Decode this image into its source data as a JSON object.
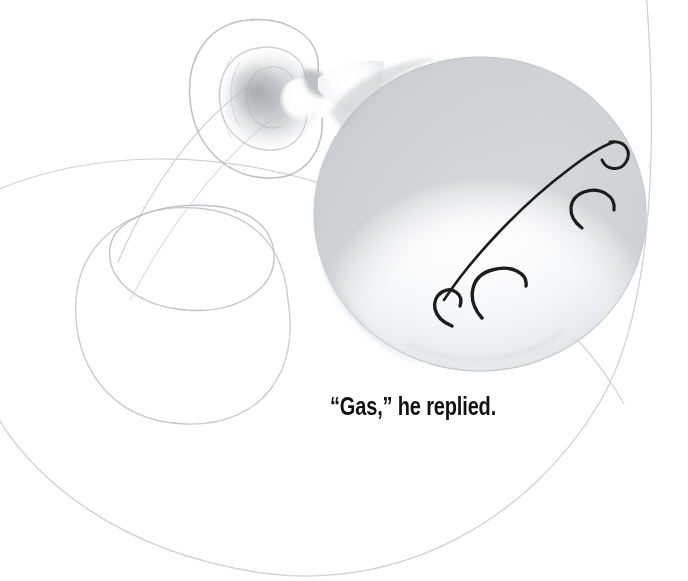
{
  "illustration": {
    "title": "Balloon with curly string",
    "medium": "pencil-sketch",
    "background_color": "#ffffff",
    "subject_names": {
      "balloon": "balloon-body",
      "knot": "balloon-knot",
      "string": "balloon-string-spiral",
      "motion_lines": "gas-motion-lines"
    }
  },
  "caption": {
    "text": "“Gas,” he replied.",
    "color": "#111111",
    "x": 330,
    "y": 392,
    "font_size_px": 25,
    "weight": "bold",
    "style": "condensed-sans"
  },
  "palette": {
    "paper": "#ffffff",
    "pencil_light": "#cfd0d2",
    "pencil_mid": "#a9abae",
    "pencil_dark": "#8e9094",
    "balloon_fill_light": "#fbfbfc",
    "balloon_fill_shadow": "#e4e5e7",
    "balloon_edge": "#c2c4c7",
    "knot_smudge": "#b9bbbe",
    "ink_black": "#1a1a1a"
  },
  "shapes": {
    "balloon": {
      "name": "balloon-body",
      "center_x": 478,
      "center_y": 213,
      "radius_x": 168,
      "radius_y": 158,
      "description": "large round shaded balloon occupying the right-center of the frame"
    },
    "knot": {
      "name": "balloon-knot",
      "center_x": 272,
      "center_y": 95,
      "radius": 45,
      "description": "dark pencil smudge knot with white highlight at the balloon neck"
    },
    "neck": {
      "name": "balloon-neck",
      "x": 300,
      "y": 70,
      "width": 34,
      "height": 30
    },
    "string_loops": [
      {
        "name": "string-loop-top",
        "cx": 255,
        "cy": 88,
        "rx": 66,
        "ry": 72
      },
      {
        "name": "string-loop-inner-small",
        "cx": 268,
        "cy": 100,
        "rx": 34,
        "ry": 42
      },
      {
        "name": "string-loop-mid",
        "cx": 192,
        "cy": 257,
        "rx": 84,
        "ry": 53
      },
      {
        "name": "string-loop-large",
        "cx": 183,
        "cy": 321,
        "rx": 108,
        "ry": 100
      }
    ],
    "outer_arc": {
      "name": "outer-sweep-arc",
      "description": "very large faint pencil arc sweeping from the left edge, down across the bottom, and up off the top-right corner",
      "left_edge_y": 196,
      "bottom_y": 574,
      "top_right_x": 646
    },
    "motion_lines": [
      {
        "name": "main-diagonal-stroke",
        "from_x": 440,
        "from_y": 322,
        "to_x": 618,
        "to_y": 143,
        "has_curl_both_ends": true
      },
      {
        "name": "curl-upper-right",
        "cx": 606,
        "cy": 152,
        "r": 18
      },
      {
        "name": "curl-middle",
        "cx": 594,
        "cy": 212,
        "r": 22
      },
      {
        "name": "curl-lower",
        "cx": 499,
        "cy": 293,
        "r": 25
      }
    ]
  }
}
